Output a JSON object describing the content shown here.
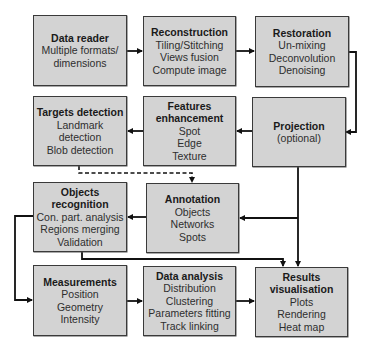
{
  "diagram": {
    "colors": {
      "box_fill": "#d3d3d3",
      "box_border": "#3a3a3a",
      "arrow": "#111111"
    },
    "boxes": {
      "data_reader": {
        "title": "Data reader",
        "lines": [
          "Multiple formats/",
          "dimensions"
        ]
      },
      "reconstruction": {
        "title": "Reconstruction",
        "lines": [
          "Tiling/Stitching",
          "Views fusion",
          "Compute image"
        ]
      },
      "restoration": {
        "title": "Restoration",
        "lines": [
          "Un-mixing",
          "Deconvolution",
          "Denoising"
        ]
      },
      "targets_detection": {
        "title": "Targets detection",
        "lines": [
          "Landmark",
          "detection",
          "Blob detection"
        ]
      },
      "features_enhancement": {
        "title_lines": [
          "Features",
          "enhancement"
        ],
        "lines": [
          "Spot",
          "Edge",
          "Texture"
        ]
      },
      "projection": {
        "title": "Projection",
        "lines": [
          "(optional)"
        ]
      },
      "objects_recognition": {
        "title_lines": [
          "Objects",
          "recognition"
        ],
        "lines": [
          "Con. part. analysis",
          "Regions merging",
          "Validation"
        ]
      },
      "annotation": {
        "title": "Annotation",
        "lines": [
          "Objects",
          "Networks",
          "Spots"
        ]
      },
      "measurements": {
        "title": "Measurements",
        "lines": [
          "Position",
          "Geometry",
          "Intensity"
        ]
      },
      "data_analysis": {
        "title": "Data analysis",
        "lines": [
          "Distribution",
          "Clustering",
          "Parameters fitting",
          "Track linking"
        ]
      },
      "results_visualisation": {
        "title_lines": [
          "Results",
          "visualisation"
        ],
        "lines": [
          "Plots",
          "Rendering",
          "Heat map"
        ]
      }
    },
    "edges": [
      {
        "from": "Data reader",
        "to": "Reconstruction",
        "style": "solid"
      },
      {
        "from": "Reconstruction",
        "to": "Restoration",
        "style": "solid"
      },
      {
        "from": "Restoration",
        "to": "Projection",
        "style": "solid"
      },
      {
        "from": "Projection",
        "to": "Features enhancement",
        "style": "solid"
      },
      {
        "from": "Features enhancement",
        "to": "Targets detection",
        "style": "solid"
      },
      {
        "from": "Targets detection",
        "to": "Annotation",
        "style": "dashed"
      },
      {
        "from": "Projection",
        "to": "Annotation",
        "style": "solid"
      },
      {
        "from": "Projection",
        "to": "Results visualisation",
        "style": "solid"
      },
      {
        "from": "Annotation",
        "to": "Objects recognition",
        "style": "solid"
      },
      {
        "from": "Objects recognition",
        "to": "Results visualisation",
        "style": "solid"
      },
      {
        "from": "Objects recognition",
        "to": "Measurements",
        "style": "solid"
      },
      {
        "from": "Measurements",
        "to": "Data analysis",
        "style": "solid"
      },
      {
        "from": "Data analysis",
        "to": "Results visualisation",
        "style": "solid"
      }
    ]
  }
}
